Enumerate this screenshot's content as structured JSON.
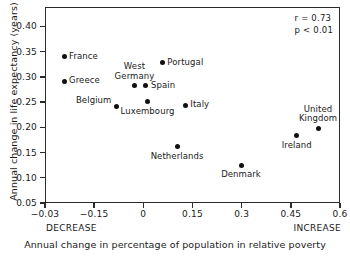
{
  "chart_data": {
    "type": "scatter",
    "title": "",
    "xlabel": "Annual change in percentage of population in relative poverty",
    "ylabel": "Annual change in life expectancy (years)",
    "xlim": [
      -0.3,
      0.6
    ],
    "ylim": [
      0.05,
      0.4383
    ],
    "grid": false,
    "legend": "none",
    "x_ticks": [
      {
        "value": -0.3,
        "label": "−0.03"
      },
      {
        "value": -0.15,
        "label": "−0.15"
      },
      {
        "value": 0,
        "label": "0"
      },
      {
        "value": 0.15,
        "label": "0.15"
      },
      {
        "value": 0.3,
        "label": "0.3"
      },
      {
        "value": 0.45,
        "label": "0.45"
      },
      {
        "value": 0.6,
        "label": "0.6"
      }
    ],
    "y_ticks": [
      {
        "value": 0.05,
        "label": "0.05"
      },
      {
        "value": 0.1,
        "label": "0.10"
      },
      {
        "value": 0.15,
        "label": "0.15"
      },
      {
        "value": 0.2,
        "label": "0.20"
      },
      {
        "value": 0.25,
        "label": "0.25"
      },
      {
        "value": 0.3,
        "label": "0.30"
      },
      {
        "value": 0.35,
        "label": "0.35"
      },
      {
        "value": 0.4,
        "label": "0.40"
      }
    ],
    "x_axis_end_labels": {
      "left": "DECREASE",
      "right": "INCREASE"
    },
    "annotations": {
      "r": "r = 0.73",
      "p": "p < 0.01"
    },
    "marker_color": "#111111",
    "axis_color": "#2b2b2b",
    "points": [
      {
        "label": "France",
        "x": -0.245,
        "y": 0.342,
        "label_pos": "right"
      },
      {
        "label": "Greece",
        "x": -0.245,
        "y": 0.293,
        "label_pos": "right"
      },
      {
        "label": "Belgium",
        "x": -0.085,
        "y": 0.243,
        "label_pos": "above-left"
      },
      {
        "label": "West Germany",
        "x": -0.03,
        "y": 0.285,
        "label_pos": "above"
      },
      {
        "label": "Spain",
        "x": 0.005,
        "y": 0.284,
        "label_pos": "right"
      },
      {
        "label": "Luxembourg",
        "x": 0.01,
        "y": 0.253,
        "label_pos": "below"
      },
      {
        "label": "Portugal",
        "x": 0.055,
        "y": 0.33,
        "label_pos": "right"
      },
      {
        "label": "Italy",
        "x": 0.125,
        "y": 0.246,
        "label_pos": "right"
      },
      {
        "label": "Netherlands",
        "x": 0.1,
        "y": 0.163,
        "label_pos": "below"
      },
      {
        "label": "Denmark",
        "x": 0.295,
        "y": 0.127,
        "label_pos": "below"
      },
      {
        "label": "Ireland",
        "x": 0.465,
        "y": 0.185,
        "label_pos": "below"
      },
      {
        "label": "United Kingdom",
        "x": 0.53,
        "y": 0.2,
        "label_pos": "above"
      }
    ]
  }
}
